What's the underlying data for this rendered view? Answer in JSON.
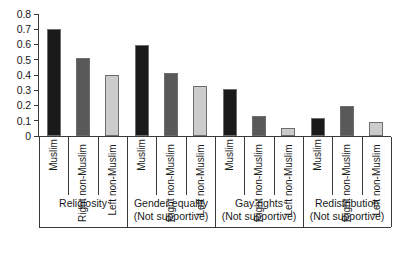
{
  "chart_data": {
    "type": "bar",
    "title": "",
    "subtitle": "",
    "xlabel": "",
    "ylabel": "",
    "ylim": [
      0,
      0.8
    ],
    "grid": false,
    "legend_position": "none",
    "orientation": "vertical",
    "grouped": true,
    "y_ticks": [
      "0",
      "0.1",
      "0.2",
      "0.3",
      "0.4",
      "0.5",
      "0.6",
      "0.7",
      "0.8"
    ],
    "y_tick_values": [
      0,
      0.1,
      0.2,
      0.3,
      0.4,
      0.5,
      0.6,
      0.7,
      0.8
    ],
    "categories": [
      "Religiosity",
      "Gender equality (Not supportive)",
      "Gay rights (Not supportive)",
      "Redistribution (Not supportive)"
    ],
    "group_labels": [
      {
        "line1": "Religiosity",
        "line2": ""
      },
      {
        "line1": "Gender equality",
        "line2": "(Not supportive)"
      },
      {
        "line1": "Gay rights",
        "line2": "(Not supportive)"
      },
      {
        "line1": "Redistribution",
        "line2": "(Not supportive)"
      }
    ],
    "subcategories": [
      "Muslim",
      "Right non-Muslim",
      "Left non-Muslim"
    ],
    "series": [
      {
        "name": "Muslim",
        "color": "#1a1a1a",
        "values": [
          0.7,
          0.6,
          0.31,
          0.12
        ]
      },
      {
        "name": "Right non-Muslim",
        "color": "#595959",
        "values": [
          0.51,
          0.41,
          0.13,
          0.2
        ]
      },
      {
        "name": "Left non-Muslim",
        "color": "#cccccc",
        "values": [
          0.4,
          0.33,
          0.05,
          0.09
        ]
      }
    ],
    "bars": [
      {
        "group": "Religiosity",
        "subcategory": "Muslim",
        "value": 0.7,
        "color": "#1a1a1a"
      },
      {
        "group": "Religiosity",
        "subcategory": "Right non-Muslim",
        "value": 0.51,
        "color": "#595959"
      },
      {
        "group": "Religiosity",
        "subcategory": "Left non-Muslim",
        "value": 0.4,
        "color": "#cccccc"
      },
      {
        "group": "Gender equality (Not supportive)",
        "subcategory": "Muslim",
        "value": 0.6,
        "color": "#1a1a1a"
      },
      {
        "group": "Gender equality (Not supportive)",
        "subcategory": "Right non-Muslim",
        "value": 0.41,
        "color": "#595959"
      },
      {
        "group": "Gender equality (Not supportive)",
        "subcategory": "Left non-Muslim",
        "value": 0.33,
        "color": "#cccccc"
      },
      {
        "group": "Gay rights (Not supportive)",
        "subcategory": "Muslim",
        "value": 0.31,
        "color": "#1a1a1a"
      },
      {
        "group": "Gay rights (Not supportive)",
        "subcategory": "Right non-Muslim",
        "value": 0.13,
        "color": "#595959"
      },
      {
        "group": "Gay rights (Not supportive)",
        "subcategory": "Left non-Muslim",
        "value": 0.05,
        "color": "#cccccc"
      },
      {
        "group": "Redistribution (Not supportive)",
        "subcategory": "Muslim",
        "value": 0.12,
        "color": "#1a1a1a"
      },
      {
        "group": "Redistribution (Not supportive)",
        "subcategory": "Right non-Muslim",
        "value": 0.2,
        "color": "#595959"
      },
      {
        "group": "Redistribution (Not supportive)",
        "subcategory": "Left non-Muslim",
        "value": 0.09,
        "color": "#cccccc"
      }
    ],
    "colors": {
      "muslim": "#1a1a1a",
      "right_non_muslim": "#595959",
      "left_non_muslim": "#cccccc",
      "axis": "#3a3a3a",
      "bar_outline": "#6e6e6e",
      "background": "#ffffff",
      "text": "#1a1a1a"
    }
  }
}
